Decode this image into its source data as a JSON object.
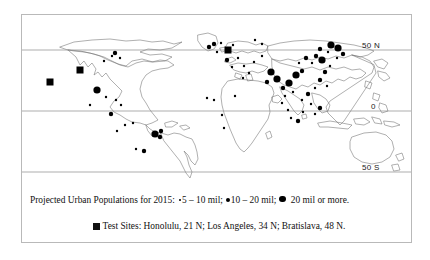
{
  "figure": {
    "border_color": "#b9b9b9",
    "marker_color": "#000000",
    "background": "#ffffff"
  },
  "latitude_labels": [
    {
      "text": "50 N",
      "x": 361,
      "y": 35
    },
    {
      "text": "0",
      "x": 370,
      "y": 96
    },
    {
      "text": "50 S",
      "x": 361,
      "y": 157
    }
  ],
  "legend": {
    "line1": {
      "intro": "Projected Urban Populations for 2015:",
      "item1_label": "5 – 10 mil;",
      "item1_marker": "small-dot",
      "item2_label": "10 – 20 mil;",
      "item2_marker": "medium-dot",
      "item3_label": "20 mil or more.",
      "item3_marker": "large-dot"
    },
    "line2": {
      "marker": "filled-square",
      "text": "Test Sites: Honolulu, 21 N; Los Angeles, 34 N; Bratislava, 48 N."
    }
  },
  "chart_data": {
    "type": "scatter",
    "title": "Projected Urban Populations for 2015",
    "xlabel": "Longitude",
    "ylabel": "Latitude",
    "xlim": [
      -180,
      180
    ],
    "ylim": [
      -60,
      83
    ],
    "grid": false,
    "projection": "equirectangular",
    "gridlines": [
      {
        "label": "50 N",
        "lat": 50
      },
      {
        "label": "0",
        "lat": 0
      },
      {
        "label": "50 S",
        "lat": -50
      }
    ],
    "legend_position": "below-plot",
    "size_classes": [
      {
        "name": "small-dot",
        "label": "5 – 10 mil",
        "radius_px": 1.2
      },
      {
        "name": "medium-dot",
        "label": "10 – 20 mil",
        "radius_px": 2.2
      },
      {
        "name": "large-dot",
        "label": "20 mil or more",
        "radius_px": 3.6
      },
      {
        "name": "filled-square",
        "label": "Test Sites",
        "size_px": 7
      }
    ],
    "test_sites": [
      {
        "name": "Honolulu",
        "lat_label": "21 N",
        "x": 50,
        "y": 82
      },
      {
        "name": "Los Angeles",
        "lat_label": "34 N",
        "x": 80,
        "y": 70
      },
      {
        "name": "Bratislava",
        "lat_label": "48 N",
        "x": 228,
        "y": 50
      }
    ],
    "cities": [
      {
        "x": 97,
        "y": 90,
        "class": "large-dot"
      },
      {
        "x": 115,
        "y": 53,
        "class": "medium-dot"
      },
      {
        "x": 112,
        "y": 56,
        "class": "small-dot"
      },
      {
        "x": 120,
        "y": 58,
        "class": "small-dot"
      },
      {
        "x": 104,
        "y": 61,
        "class": "small-dot"
      },
      {
        "x": 106,
        "y": 97,
        "class": "small-dot"
      },
      {
        "x": 116,
        "y": 100,
        "class": "small-dot"
      },
      {
        "x": 121,
        "y": 105,
        "class": "small-dot"
      },
      {
        "x": 90,
        "y": 105,
        "class": "small-dot"
      },
      {
        "x": 111,
        "y": 114,
        "class": "medium-dot"
      },
      {
        "x": 125,
        "y": 125,
        "class": "small-dot"
      },
      {
        "x": 117,
        "y": 131,
        "class": "small-dot"
      },
      {
        "x": 155,
        "y": 134,
        "class": "large-dot"
      },
      {
        "x": 161,
        "y": 131,
        "class": "medium-dot"
      },
      {
        "x": 160,
        "y": 137,
        "class": "medium-dot"
      },
      {
        "x": 136,
        "y": 149,
        "class": "small-dot"
      },
      {
        "x": 144,
        "y": 151,
        "class": "medium-dot"
      },
      {
        "x": 133,
        "y": 123,
        "class": "small-dot"
      },
      {
        "x": 209,
        "y": 47,
        "class": "medium-dot"
      },
      {
        "x": 214,
        "y": 44,
        "class": "medium-dot"
      },
      {
        "x": 217,
        "y": 52,
        "class": "small-dot"
      },
      {
        "x": 221,
        "y": 43,
        "class": "small-dot"
      },
      {
        "x": 233,
        "y": 45,
        "class": "small-dot"
      },
      {
        "x": 238,
        "y": 58,
        "class": "small-dot"
      },
      {
        "x": 227,
        "y": 60,
        "class": "medium-dot"
      },
      {
        "x": 232,
        "y": 67,
        "class": "small-dot"
      },
      {
        "x": 244,
        "y": 66,
        "class": "small-dot"
      },
      {
        "x": 249,
        "y": 73,
        "class": "small-dot"
      },
      {
        "x": 243,
        "y": 78,
        "class": "small-dot"
      },
      {
        "x": 235,
        "y": 96,
        "class": "small-dot"
      },
      {
        "x": 222,
        "y": 115,
        "class": "small-dot"
      },
      {
        "x": 214,
        "y": 100,
        "class": "small-dot"
      },
      {
        "x": 207,
        "y": 98,
        "class": "small-dot"
      },
      {
        "x": 224,
        "y": 128,
        "class": "small-dot"
      },
      {
        "x": 254,
        "y": 62,
        "class": "small-dot"
      },
      {
        "x": 262,
        "y": 56,
        "class": "small-dot"
      },
      {
        "x": 271,
        "y": 72,
        "class": "large-dot"
      },
      {
        "x": 277,
        "y": 79,
        "class": "large-dot"
      },
      {
        "x": 267,
        "y": 82,
        "class": "medium-dot"
      },
      {
        "x": 283,
        "y": 88,
        "class": "medium-dot"
      },
      {
        "x": 289,
        "y": 83,
        "class": "large-dot"
      },
      {
        "x": 296,
        "y": 75,
        "class": "large-dot"
      },
      {
        "x": 302,
        "y": 71,
        "class": "medium-dot"
      },
      {
        "x": 293,
        "y": 92,
        "class": "small-dot"
      },
      {
        "x": 285,
        "y": 96,
        "class": "small-dot"
      },
      {
        "x": 299,
        "y": 63,
        "class": "small-dot"
      },
      {
        "x": 306,
        "y": 58,
        "class": "medium-dot"
      },
      {
        "x": 312,
        "y": 63,
        "class": "small-dot"
      },
      {
        "x": 316,
        "y": 56,
        "class": "medium-dot"
      },
      {
        "x": 322,
        "y": 60,
        "class": "large-dot"
      },
      {
        "x": 320,
        "y": 49,
        "class": "medium-dot"
      },
      {
        "x": 328,
        "y": 52,
        "class": "small-dot"
      },
      {
        "x": 331,
        "y": 45,
        "class": "large-dot"
      },
      {
        "x": 338,
        "y": 48,
        "class": "large-dot"
      },
      {
        "x": 343,
        "y": 54,
        "class": "medium-dot"
      },
      {
        "x": 337,
        "y": 58,
        "class": "small-dot"
      },
      {
        "x": 330,
        "y": 66,
        "class": "small-dot"
      },
      {
        "x": 325,
        "y": 72,
        "class": "medium-dot"
      },
      {
        "x": 320,
        "y": 80,
        "class": "medium-dot"
      },
      {
        "x": 327,
        "y": 86,
        "class": "small-dot"
      },
      {
        "x": 315,
        "y": 88,
        "class": "small-dot"
      },
      {
        "x": 308,
        "y": 94,
        "class": "medium-dot"
      },
      {
        "x": 302,
        "y": 100,
        "class": "small-dot"
      },
      {
        "x": 311,
        "y": 104,
        "class": "small-dot"
      },
      {
        "x": 303,
        "y": 112,
        "class": "small-dot"
      },
      {
        "x": 315,
        "y": 114,
        "class": "small-dot"
      },
      {
        "x": 320,
        "y": 108,
        "class": "medium-dot"
      },
      {
        "x": 298,
        "y": 121,
        "class": "medium-dot"
      },
      {
        "x": 291,
        "y": 118,
        "class": "small-dot"
      },
      {
        "x": 288,
        "y": 110,
        "class": "small-dot"
      },
      {
        "x": 282,
        "y": 103,
        "class": "small-dot"
      },
      {
        "x": 262,
        "y": 44,
        "class": "small-dot"
      },
      {
        "x": 255,
        "y": 40,
        "class": "small-dot"
      }
    ]
  }
}
